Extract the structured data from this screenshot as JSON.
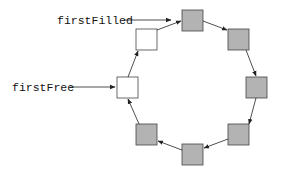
{
  "diagram": {
    "type": "circular-buffer",
    "colors": {
      "filled": "#b3b3b3",
      "free": "#ffffff",
      "stroke": "#444444"
    },
    "labels": {
      "first_filled": "firstFilled",
      "first_free": "firstFree"
    },
    "slots": [
      {
        "position": "top",
        "state": "filled"
      },
      {
        "position": "upper-right",
        "state": "filled"
      },
      {
        "position": "right",
        "state": "filled"
      },
      {
        "position": "lower-right",
        "state": "filled"
      },
      {
        "position": "bottom",
        "state": "filled"
      },
      {
        "position": "lower-left",
        "state": "filled"
      },
      {
        "position": "left",
        "state": "free"
      },
      {
        "position": "upper-left",
        "state": "free"
      }
    ]
  }
}
